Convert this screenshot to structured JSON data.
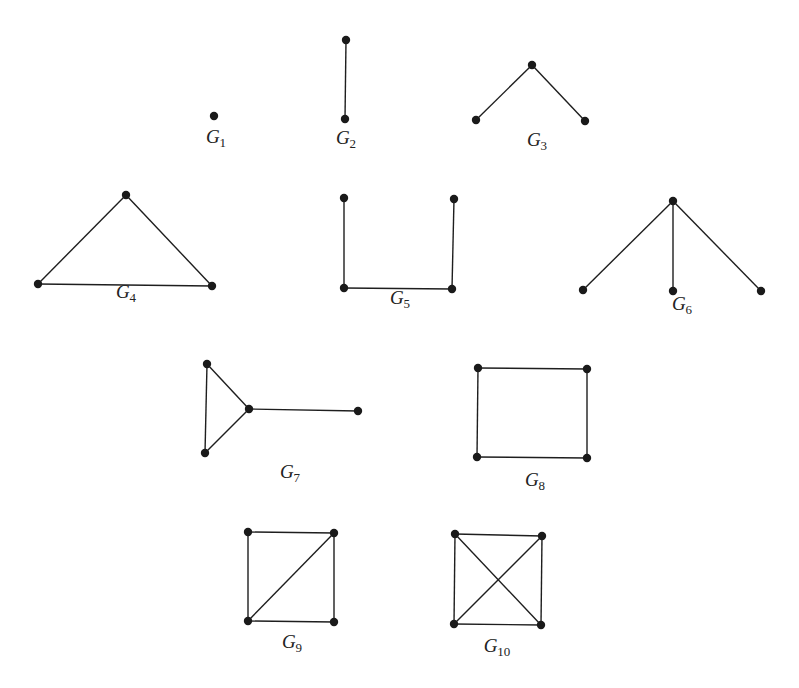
{
  "figure": {
    "background": "#ffffff",
    "ink_color": "#1a1a1a",
    "graphs": [
      {
        "id": "G1",
        "label": "G",
        "subscript": "1",
        "label_pos": [
          216,
          140
        ],
        "nodes": [
          [
            214,
            116
          ]
        ],
        "edges": []
      },
      {
        "id": "G2",
        "label": "G",
        "subscript": "2",
        "label_pos": [
          346,
          141
        ],
        "nodes": [
          [
            346,
            40
          ],
          [
            345,
            119
          ]
        ],
        "edges": [
          [
            0,
            1
          ]
        ]
      },
      {
        "id": "G3",
        "label": "G",
        "subscript": "3",
        "label_pos": [
          537,
          143
        ],
        "nodes": [
          [
            532,
            65
          ],
          [
            476,
            120
          ],
          [
            585,
            121
          ]
        ],
        "edges": [
          [
            0,
            1
          ],
          [
            0,
            2
          ]
        ]
      },
      {
        "id": "G4",
        "label": "G",
        "subscript": "4",
        "label_pos": [
          126,
          295
        ],
        "nodes": [
          [
            126,
            195
          ],
          [
            38,
            284
          ],
          [
            212,
            286
          ]
        ],
        "edges": [
          [
            0,
            1
          ],
          [
            0,
            2
          ],
          [
            1,
            2
          ]
        ]
      },
      {
        "id": "G5",
        "label": "G",
        "subscript": "5",
        "label_pos": [
          400,
          301
        ],
        "nodes": [
          [
            344,
            198
          ],
          [
            454,
            199
          ],
          [
            344,
            288
          ],
          [
            452,
            289
          ]
        ],
        "edges": [
          [
            0,
            2
          ],
          [
            2,
            3
          ],
          [
            1,
            3
          ]
        ]
      },
      {
        "id": "G6",
        "label": "G",
        "subscript": "6",
        "label_pos": [
          682,
          307
        ],
        "nodes": [
          [
            673,
            201
          ],
          [
            583,
            290
          ],
          [
            673,
            291
          ],
          [
            761,
            291
          ]
        ],
        "edges": [
          [
            0,
            1
          ],
          [
            0,
            2
          ],
          [
            0,
            3
          ]
        ]
      },
      {
        "id": "G7",
        "label": "G",
        "subscript": "7",
        "label_pos": [
          290,
          475
        ],
        "nodes": [
          [
            207,
            364
          ],
          [
            249,
            409
          ],
          [
            358,
            411
          ],
          [
            205,
            453
          ]
        ],
        "edges": [
          [
            0,
            1
          ],
          [
            0,
            3
          ],
          [
            1,
            3
          ],
          [
            1,
            2
          ]
        ]
      },
      {
        "id": "G8",
        "label": "G",
        "subscript": "8",
        "label_pos": [
          535,
          483
        ],
        "nodes": [
          [
            478,
            368
          ],
          [
            587,
            369
          ],
          [
            477,
            457
          ],
          [
            587,
            458
          ]
        ],
        "edges": [
          [
            0,
            1
          ],
          [
            0,
            2
          ],
          [
            1,
            3
          ],
          [
            2,
            3
          ]
        ]
      },
      {
        "id": "G9",
        "label": "G",
        "subscript": "9",
        "label_pos": [
          292,
          645
        ],
        "nodes": [
          [
            248,
            532
          ],
          [
            334,
            533
          ],
          [
            248,
            621
          ],
          [
            334,
            622
          ]
        ],
        "edges": [
          [
            0,
            1
          ],
          [
            0,
            2
          ],
          [
            1,
            3
          ],
          [
            2,
            3
          ],
          [
            1,
            2
          ]
        ]
      },
      {
        "id": "G10",
        "label": "G",
        "subscript": "10",
        "label_pos": [
          497,
          649
        ],
        "nodes": [
          [
            455,
            534
          ],
          [
            542,
            536
          ],
          [
            454,
            624
          ],
          [
            541,
            625
          ]
        ],
        "edges": [
          [
            0,
            1
          ],
          [
            0,
            2
          ],
          [
            1,
            3
          ],
          [
            2,
            3
          ],
          [
            0,
            3
          ],
          [
            1,
            2
          ]
        ]
      }
    ]
  }
}
